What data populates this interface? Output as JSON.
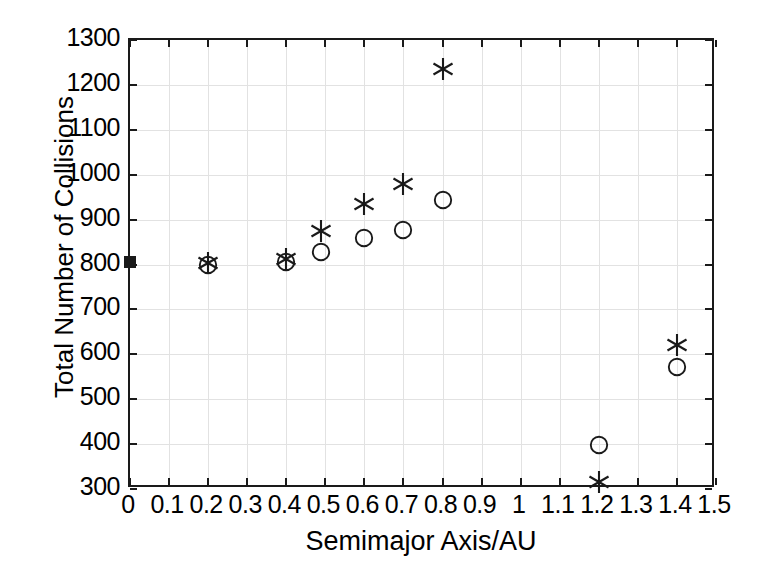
{
  "chart_data": {
    "type": "scatter",
    "title": "",
    "xlabel": "Semimajor Axis/AU",
    "ylabel": "Total Number of Collisions",
    "xlim": [
      0,
      1.5
    ],
    "ylim": [
      300,
      1300
    ],
    "xticks": [
      "0",
      "0.1",
      "0.2",
      "0.3",
      "0.4",
      "0.5",
      "0.6",
      "0.7",
      "0.8",
      "0.9",
      "1",
      "1.1",
      "1.2",
      "1.3",
      "1.4",
      "1.5"
    ],
    "xtick_values": [
      0,
      0.1,
      0.2,
      0.3,
      0.4,
      0.5,
      0.6,
      0.7,
      0.8,
      0.9,
      1.0,
      1.1,
      1.2,
      1.3,
      1.4,
      1.5
    ],
    "yticks": [
      "300",
      "400",
      "500",
      "600",
      "700",
      "800",
      "900",
      "1000",
      "1100",
      "1200",
      "1300"
    ],
    "ytick_values": [
      300,
      400,
      500,
      600,
      700,
      800,
      900,
      1000,
      1100,
      1200,
      1300
    ],
    "grid": true,
    "legend": "none",
    "marker_color": "#1a1a1a",
    "series": [
      {
        "name": "asterisk",
        "marker": "asterisk",
        "points": [
          {
            "x": 0.2,
            "y": 803
          },
          {
            "x": 0.4,
            "y": 812
          },
          {
            "x": 0.49,
            "y": 875
          },
          {
            "x": 0.6,
            "y": 935
          },
          {
            "x": 0.7,
            "y": 980
          },
          {
            "x": 0.8,
            "y": 1235
          },
          {
            "x": 1.2,
            "y": 315
          },
          {
            "x": 1.4,
            "y": 620
          }
        ]
      },
      {
        "name": "circle",
        "marker": "circle",
        "points": [
          {
            "x": 0.2,
            "y": 800
          },
          {
            "x": 0.4,
            "y": 806
          },
          {
            "x": 0.49,
            "y": 828
          },
          {
            "x": 0.6,
            "y": 858
          },
          {
            "x": 0.7,
            "y": 877
          },
          {
            "x": 0.8,
            "y": 943
          },
          {
            "x": 1.2,
            "y": 397
          },
          {
            "x": 1.4,
            "y": 572
          }
        ]
      },
      {
        "name": "filled-square",
        "marker": "square",
        "points": [
          {
            "x": 0.0,
            "y": 805
          }
        ]
      }
    ]
  }
}
